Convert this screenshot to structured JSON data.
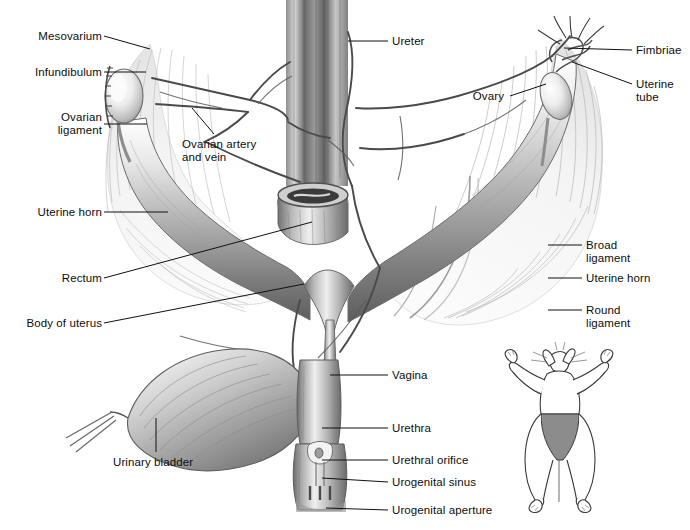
{
  "figure": {
    "background_color": "#ffffff",
    "ink_color": "#0d0d0d",
    "tissue_light": "#f2f2f2",
    "tissue_mid": "#bdbdbd",
    "tissue_dark": "#6e6e6e",
    "inset_shade_color": "#8c8c8c"
  },
  "labels": [
    {
      "id": "mesovarium",
      "text": "Mesovarium",
      "align": "right",
      "x": 10,
      "y": 30,
      "w": 92,
      "leader": [
        [
          104,
          36
        ],
        [
          150,
          49
        ]
      ]
    },
    {
      "id": "infundibulum",
      "text": "Infundibulum",
      "align": "right",
      "x": 8,
      "y": 66,
      "w": 94,
      "leader": [
        [
          104,
          72
        ],
        [
          146,
          72
        ]
      ]
    },
    {
      "id": "ovarian-ligament",
      "text": "Ovarian\nligament",
      "align": "right",
      "x": 8,
      "y": 111,
      "w": 94,
      "leader": [
        [
          104,
          124
        ],
        [
          147,
          124
        ]
      ]
    },
    {
      "id": "ovarian-artery-vein",
      "text": "Ovarian artery\nand vein",
      "align": "left",
      "x": 182,
      "y": 138,
      "w": 110,
      "leader": [
        [
          214,
          134
        ],
        [
          192,
          108
        ]
      ]
    },
    {
      "id": "ureter",
      "text": "Ureter",
      "align": "left",
      "x": 392,
      "y": 35,
      "w": 70,
      "leader": [
        [
          388,
          41
        ],
        [
          348,
          41
        ]
      ]
    },
    {
      "id": "fimbriae",
      "text": "Fimbriae",
      "align": "left",
      "x": 636,
      "y": 44,
      "w": 60,
      "leader": [
        [
          632,
          50
        ],
        [
          564,
          48
        ]
      ]
    },
    {
      "id": "uterine-tube",
      "text": "Uterine\ntube",
      "align": "left",
      "x": 636,
      "y": 78,
      "w": 60,
      "leader": [
        [
          632,
          84
        ],
        [
          572,
          62
        ]
      ]
    },
    {
      "id": "ovary",
      "text": "Ovary",
      "align": "right",
      "x": 452,
      "y": 90,
      "w": 52,
      "leader": [
        [
          510,
          96
        ],
        [
          546,
          84
        ]
      ]
    },
    {
      "id": "uterine-horn-left",
      "text": "Uterine horn",
      "align": "right",
      "x": 8,
      "y": 206,
      "w": 94,
      "leader": [
        [
          104,
          212
        ],
        [
          168,
          212
        ]
      ]
    },
    {
      "id": "rectum",
      "text": "Rectum",
      "align": "right",
      "x": 8,
      "y": 272,
      "w": 94,
      "leader": [
        [
          104,
          278
        ],
        [
          312,
          222
        ]
      ]
    },
    {
      "id": "body-of-uterus",
      "text": "Body of uterus",
      "align": "right",
      "x": 8,
      "y": 317,
      "w": 94,
      "leader": [
        [
          104,
          323
        ],
        [
          304,
          284
        ]
      ]
    },
    {
      "id": "broad-ligament",
      "text": "Broad\nligament",
      "align": "left",
      "x": 586,
      "y": 239,
      "w": 92,
      "leader": [
        [
          582,
          245
        ],
        [
          548,
          245
        ]
      ]
    },
    {
      "id": "uterine-horn-right",
      "text": "Uterine horn",
      "align": "left",
      "x": 586,
      "y": 272,
      "w": 92,
      "leader": [
        [
          582,
          278
        ],
        [
          548,
          278
        ]
      ]
    },
    {
      "id": "round-ligament",
      "text": "Round\nligament",
      "align": "left",
      "x": 586,
      "y": 304,
      "w": 92,
      "leader": [
        [
          582,
          310
        ],
        [
          548,
          310
        ]
      ]
    },
    {
      "id": "vagina",
      "text": "Vagina",
      "align": "left",
      "x": 392,
      "y": 369,
      "w": 72,
      "leader": [
        [
          388,
          375
        ],
        [
          330,
          375
        ]
      ]
    },
    {
      "id": "urethra",
      "text": "Urethra",
      "align": "left",
      "x": 392,
      "y": 422,
      "w": 72,
      "leader": [
        [
          388,
          428
        ],
        [
          322,
          428
        ]
      ]
    },
    {
      "id": "urethral-orifice",
      "text": "Urethral orifice",
      "align": "left",
      "x": 392,
      "y": 454,
      "w": 104,
      "leader": [
        [
          388,
          460
        ],
        [
          322,
          460
        ]
      ]
    },
    {
      "id": "urogenital-sinus",
      "text": "Urogenital sinus",
      "align": "left",
      "x": 392,
      "y": 476,
      "w": 110,
      "leader": [
        [
          388,
          482
        ],
        [
          322,
          478
        ]
      ]
    },
    {
      "id": "urogenital-aperture",
      "text": "Urogenital aperture",
      "align": "left",
      "x": 392,
      "y": 504,
      "w": 130,
      "leader": [
        [
          388,
          510
        ],
        [
          326,
          508
        ]
      ]
    },
    {
      "id": "urinary-bladder",
      "text": "Urinary bladder",
      "align": "left",
      "x": 113,
      "y": 456,
      "w": 110,
      "leader": [
        [
          156,
          452
        ],
        [
          156,
          418
        ]
      ]
    }
  ],
  "structures": [
    {
      "id": "left-ovary",
      "name": "left ovary"
    },
    {
      "id": "right-ovary",
      "name": "right ovary"
    },
    {
      "id": "left-broad-ligament",
      "name": "left broad ligament"
    },
    {
      "id": "right-broad-ligament",
      "name": "right broad ligament"
    },
    {
      "id": "left-uterine-horn",
      "name": "left uterine horn"
    },
    {
      "id": "right-uterine-horn",
      "name": "right uterine horn"
    },
    {
      "id": "uterus-body",
      "name": "body of uterus"
    },
    {
      "id": "rectum-stump",
      "name": "cut rectum stump"
    },
    {
      "id": "colon-column",
      "name": "descending colon column"
    },
    {
      "id": "urinary-bladder",
      "name": "urinary bladder"
    },
    {
      "id": "vagina-canal",
      "name": "vagina"
    },
    {
      "id": "urogenital-sinus",
      "name": "urogenital sinus"
    }
  ],
  "inset": {
    "name": "cat-orientation-inset",
    "description": "Ventral view of cat with shaded abdominal region",
    "shade_color": "#8c8c8c",
    "outline_color": "#333333",
    "x": 505,
    "y": 350,
    "w": 110,
    "h": 160
  }
}
